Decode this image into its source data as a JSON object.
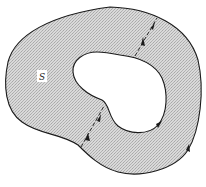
{
  "diagram": {
    "region_label": "S",
    "colors": {
      "fill": "#c8c8c8",
      "fill_light": "#e6e6e6",
      "stroke": "#1a1a1a",
      "background": "#ffffff",
      "label_bg": "#ffffff"
    },
    "elements": {
      "outer_boundary": "closed curve, counterclockwise orientation arrow at lower right",
      "inner_boundary": "hole, clockwise orientation arrow at lower right",
      "cuts": [
        {
          "name": "upper-cut",
          "arrows": "opposite directions (in/out)"
        },
        {
          "name": "lower-cut",
          "arrows": "opposite directions (in/out)"
        }
      ]
    }
  }
}
